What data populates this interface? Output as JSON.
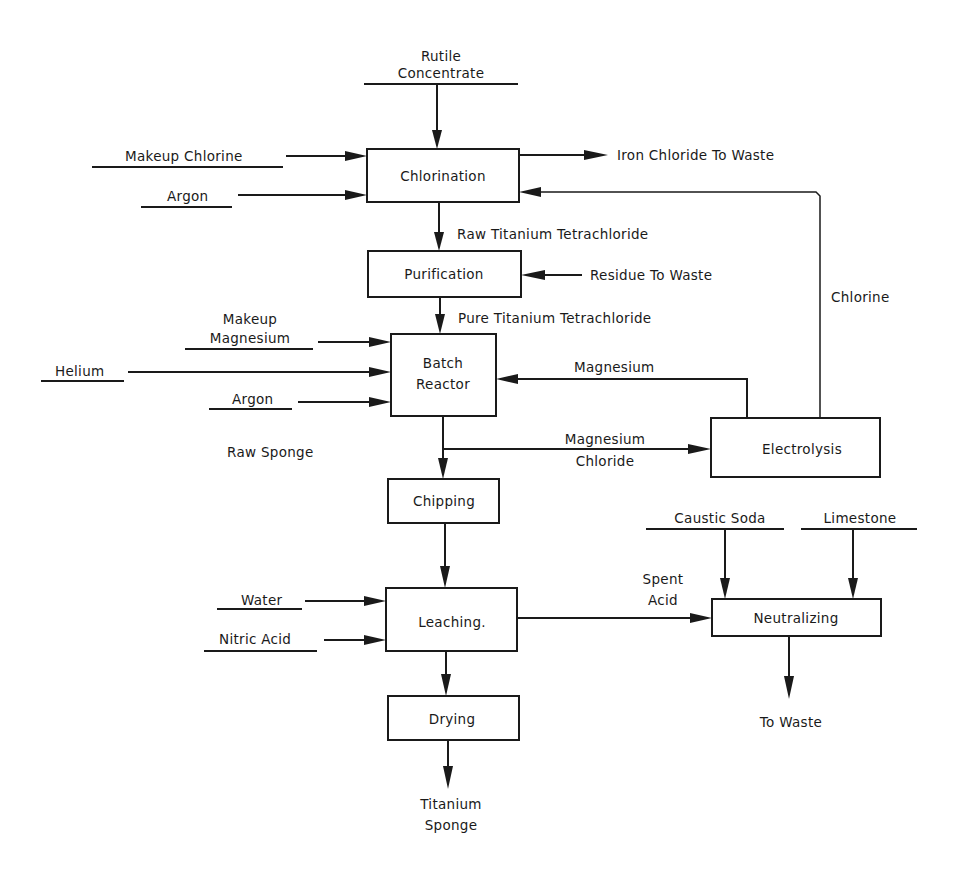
{
  "diagram": {
    "type": "process-flow",
    "colors": {
      "ink": "#1a1a1a",
      "background": "#ffffff"
    },
    "processes": {
      "chlorination": {
        "label": "Chlorination",
        "x": 367,
        "y": 149,
        "w": 152,
        "h": 53
      },
      "purification": {
        "label": "Purification",
        "x": 368,
        "y": 251,
        "w": 153,
        "h": 46
      },
      "batch_reactor": {
        "label_line1": "Batch",
        "label_line2": "Reactor",
        "x": 391,
        "y": 334,
        "w": 105,
        "h": 82
      },
      "electrolysis": {
        "label": "Electrolysis",
        "x": 711,
        "y": 418,
        "w": 169,
        "h": 59
      },
      "chipping": {
        "label": "Chipping",
        "x": 388,
        "y": 479,
        "w": 111,
        "h": 44
      },
      "leaching": {
        "label": "Leaching.",
        "x": 386,
        "y": 588,
        "w": 131,
        "h": 63
      },
      "neutralizing": {
        "label": "Neutralizing",
        "x": 712,
        "y": 599,
        "w": 169,
        "h": 37
      },
      "drying": {
        "label": "Drying",
        "x": 388,
        "y": 696,
        "w": 131,
        "h": 44
      }
    },
    "inputs": {
      "rutile_line1": "Rutile",
      "rutile_line2": "Concentrate",
      "makeup_chlorine": "Makeup Chlorine",
      "argon_chlorination": "Argon",
      "makeup_magnesium_line1": "Makeup",
      "makeup_magnesium_line2": "Magnesium",
      "helium": "Helium",
      "argon_reactor": "Argon",
      "water": "Water",
      "nitric_acid": "Nitric Acid",
      "caustic_soda": "Caustic Soda",
      "limestone": "Limestone"
    },
    "streams": {
      "iron_chloride_waste": "Iron Chloride To Waste",
      "raw_ticl4": "Raw Titanium Tetrachloride",
      "residue_waste": "Residue To Waste",
      "pure_ticl4": "Pure Titanium Tetrachloride",
      "chlorine_recycle": "Chlorine",
      "magnesium_recycle": "Magnesium",
      "mgcl2_line1": "Magnesium",
      "mgcl2_line2": "Chloride",
      "raw_sponge": "Raw Sponge",
      "spent_acid_line1": "Spent",
      "spent_acid_line2": "Acid",
      "to_waste": "To Waste"
    },
    "outputs": {
      "product_line1": "Titanium",
      "product_line2": "Sponge"
    }
  }
}
